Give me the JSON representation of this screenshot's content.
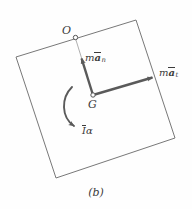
{
  "figure": {
    "caption": "(b)",
    "background_color": "#fefefe",
    "stroke_color": "#6e6e6e",
    "vector_color": "#5a5a5a",
    "text_color": "#3b3b3b",
    "points": [
      {
        "name": "O",
        "label": "O",
        "x": 75,
        "y": 37,
        "marker": "open-circle"
      },
      {
        "name": "G",
        "label": "G",
        "x": 93,
        "y": 95,
        "marker": "open-circle"
      }
    ],
    "body_outline": {
      "shape": "tilted-quadrilateral",
      "vertices": [
        {
          "x": 16,
          "y": 57
        },
        {
          "x": 136,
          "y": 20
        },
        {
          "x": 175,
          "y": 138
        },
        {
          "x": 56,
          "y": 178
        }
      ]
    },
    "vectors": [
      {
        "name": "normal-acceleration",
        "label_plain": "m a_n",
        "label_m": "m",
        "label_a": "a",
        "label_sub": "n",
        "from": {
          "x": 93,
          "y": 95
        },
        "to": {
          "x": 81,
          "y": 56
        },
        "style": "solid-arrow"
      },
      {
        "name": "tangential-acceleration",
        "label_plain": "m a_t",
        "label_m": "m",
        "label_a": "a",
        "label_sub": "t",
        "from": {
          "x": 93,
          "y": 95
        },
        "to": {
          "x": 156,
          "y": 76
        },
        "style": "solid-arrow"
      },
      {
        "name": "angular-acceleration-couple",
        "label_plain": "I alpha",
        "label_I": "I",
        "label_alpha": "α",
        "style": "curved-arrow-clockwise"
      }
    ],
    "construction_line": {
      "name": "line-O-to-G",
      "from": {
        "x": 75,
        "y": 37
      },
      "to": {
        "x": 93,
        "y": 95
      },
      "style": "thin"
    }
  }
}
